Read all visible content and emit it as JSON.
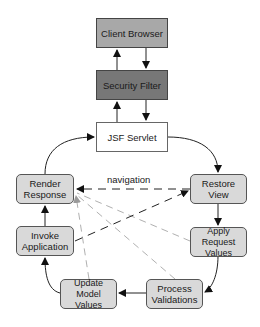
{
  "diagram": {
    "nodes": {
      "client_browser": {
        "label": "Client Browser",
        "fill": "#a8a8a8"
      },
      "security_filter": {
        "label": "Security Filter",
        "fill": "#777777"
      },
      "jsf_servlet": {
        "label": "JSF Servlet",
        "fill": "#ffffff"
      },
      "restore_view": {
        "label": "Restore\nView",
        "fill": "#d9d9d9"
      },
      "apply_request_values": {
        "label": "Apply Request\nValues",
        "fill": "#d9d9d9"
      },
      "process_validations": {
        "label": "Process\nValidations",
        "fill": "#d9d9d9"
      },
      "update_model_values": {
        "label": "Update Model\nValues",
        "fill": "#d9d9d9"
      },
      "invoke_application": {
        "label": "Invoke\nApplication",
        "fill": "#d9d9d9"
      },
      "render_response": {
        "label": "Render\nResponse",
        "fill": "#d9d9d9"
      }
    },
    "edges": [
      {
        "from": "Security Filter",
        "to": "Client Browser",
        "style": "solid"
      },
      {
        "from": "Client Browser",
        "to": "Security Filter",
        "style": "solid"
      },
      {
        "from": "JSF Servlet",
        "to": "Security Filter",
        "style": "solid"
      },
      {
        "from": "Security Filter",
        "to": "JSF Servlet",
        "style": "solid"
      },
      {
        "from": "JSF Servlet",
        "to": "Restore View",
        "style": "solid"
      },
      {
        "from": "Restore View",
        "to": "Apply Request Values",
        "style": "solid"
      },
      {
        "from": "Apply Request Values",
        "to": "Process Validations",
        "style": "solid"
      },
      {
        "from": "Process Validations",
        "to": "Update Model Values",
        "style": "solid"
      },
      {
        "from": "Update Model Values",
        "to": "Invoke Application",
        "style": "solid"
      },
      {
        "from": "Invoke Application",
        "to": "Render Response",
        "style": "solid"
      },
      {
        "from": "Render Response",
        "to": "JSF Servlet",
        "style": "solid"
      },
      {
        "from": "Restore View",
        "to": "Render Response",
        "style": "dashed",
        "label": "navigation"
      },
      {
        "from": "Invoke Application",
        "to": "Restore View",
        "style": "dashed"
      },
      {
        "from": "Apply Request Values",
        "to": "Render Response",
        "style": "dashed-light"
      },
      {
        "from": "Process Validations",
        "to": "Render Response",
        "style": "dashed-light"
      },
      {
        "from": "Update Model Values",
        "to": "Render Response",
        "style": "dashed-light"
      }
    ],
    "edge_labels": {
      "navigation": "navigation"
    }
  }
}
